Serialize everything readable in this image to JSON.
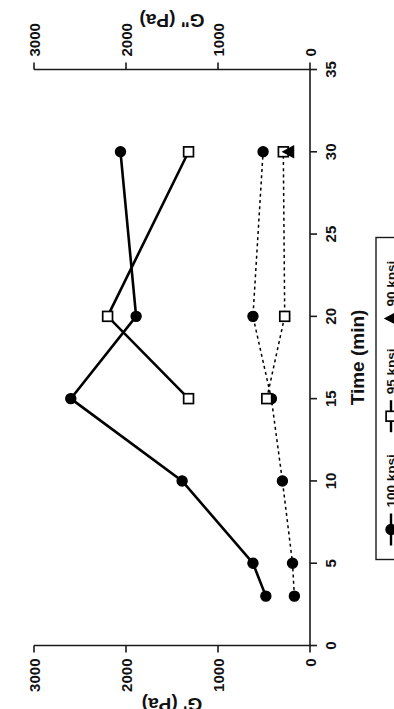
{
  "figure": {
    "orientation": "rotated-90-ccw",
    "background": "#ffffff",
    "ink_color": "#000000"
  },
  "chart_data": {
    "type": "line",
    "title": "",
    "xlabel": "Time  (min)",
    "ylabel_primary": "G'  (Pa)",
    "ylabel_secondary": "G\"  (Pa)",
    "xlim": [
      0,
      35
    ],
    "ylim": [
      0,
      3000
    ],
    "x_ticks": [
      0,
      5,
      10,
      15,
      20,
      25,
      30,
      35
    ],
    "x_tick_labels": [
      "0",
      "5",
      "10",
      "15",
      "20",
      "25",
      "30",
      "35"
    ],
    "y_ticks": [
      0,
      1000,
      2000,
      3000
    ],
    "y_tick_labels": [
      "0",
      "1000",
      "2000",
      "3000"
    ],
    "y2_ticks": [
      0,
      1000,
      2000,
      3000
    ],
    "y2_tick_labels": [
      "0",
      "1000",
      "2000",
      "3000"
    ],
    "grid": false,
    "legend_position": "right-outside",
    "series": [
      {
        "name": "100 kpsi",
        "property": "G'",
        "marker": "filled-circle",
        "linestyle": "solid",
        "x": [
          3,
          5,
          10,
          15,
          20,
          30
        ],
        "values": [
          480,
          620,
          1390,
          2600,
          1890,
          2060
        ]
      },
      {
        "name": "95 kpsi",
        "property": "G'",
        "marker": "open-square",
        "linestyle": "solid",
        "x": [
          15,
          20,
          30
        ],
        "values": [
          1320,
          2200,
          1320
        ]
      },
      {
        "name": "100 kpsi",
        "property": "G\"",
        "marker": "filled-circle",
        "linestyle": "dashed",
        "x": [
          3,
          5,
          10,
          15,
          20,
          30
        ],
        "values": [
          170,
          190,
          300,
          420,
          620,
          510
        ]
      },
      {
        "name": "95 kpsi",
        "property": "G\"",
        "marker": "open-square",
        "linestyle": "dashed",
        "x": [
          15,
          20,
          30
        ],
        "values": [
          470,
          275,
          290
        ]
      },
      {
        "name": "90 kpsi",
        "property": "G\"",
        "marker": "filled-triangle",
        "linestyle": "none",
        "x": [
          30
        ],
        "values": [
          230
        ]
      }
    ]
  },
  "legend": {
    "entries": [
      {
        "label": "100 kpsi",
        "marker": "filled-circle",
        "line": true
      },
      {
        "label": "95 kpsi",
        "marker": "open-square",
        "line": true
      },
      {
        "label": "90 kpsi",
        "marker": "filled-triangle",
        "line": false
      }
    ]
  },
  "axis_titles": {
    "time": "Time  (min)",
    "g_prime": "G'  (Pa)",
    "g_double_prime": "G\"  (Pa)"
  },
  "tick_text": {
    "time": [
      "0",
      "5",
      "10",
      "15",
      "20",
      "25",
      "30",
      "35"
    ],
    "modulus": [
      "0",
      "1000",
      "2000",
      "3000"
    ]
  }
}
